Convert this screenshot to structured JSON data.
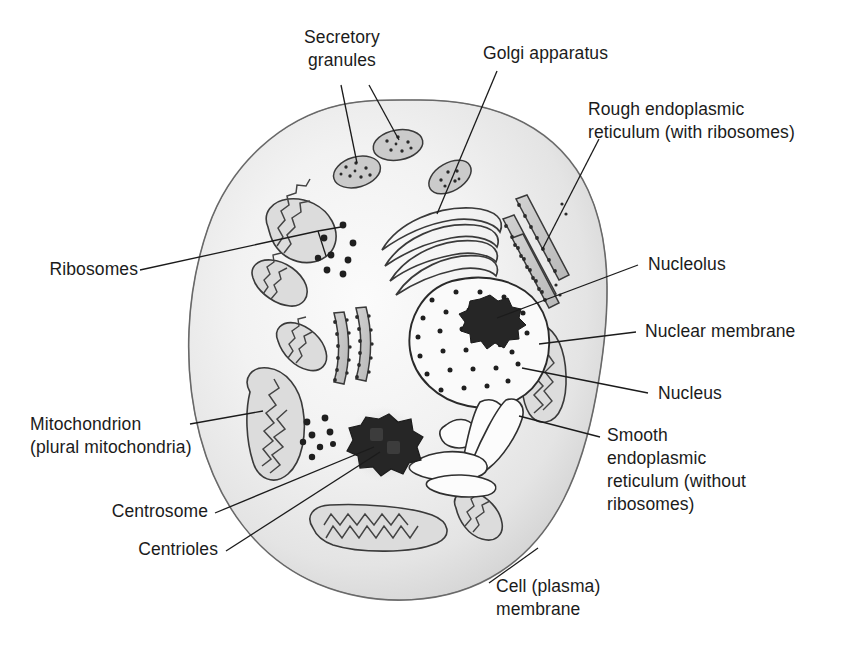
{
  "figure": {
    "kind": "animal-cell-diagram",
    "background_color": "#ffffff",
    "ink_color": "#1b1b1b",
    "cytoplasm_fill": "#e9e9e9",
    "organelle_fill": "#c9c9c9",
    "dark_fill": "#2b2b2b"
  },
  "labels": {
    "secretory_granules": "Secretory\ngranules",
    "golgi_apparatus": "Golgi apparatus",
    "rough_er": "Rough endoplasmic\nreticulum (with ribosomes)",
    "nucleolus": "Nucleolus",
    "nuclear_membrane": "Nuclear membrane",
    "nucleus": "Nucleus",
    "smooth_er": "Smooth\nendoplasmic\nreticulum (without\nribosomes)",
    "ribosomes": "Ribosomes",
    "mitochondrion": "Mitochondrion\n(plural mitochondria)",
    "centrosome": "Centrosome",
    "centrioles": "Centrioles",
    "cell_membrane": "Cell (plasma)\nmembrane"
  },
  "structures": [
    {
      "name": "cell-plasma-membrane",
      "count": 1
    },
    {
      "name": "secretory-granule",
      "count": 3
    },
    {
      "name": "mitochondrion",
      "count": 6
    },
    {
      "name": "golgi-cisterna",
      "count": 4
    },
    {
      "name": "rough-er-cisterna",
      "count": 5
    },
    {
      "name": "smooth-er-tubule",
      "count": 4
    },
    {
      "name": "ribosome-dot",
      "count": 16
    },
    {
      "name": "nucleus",
      "count": 1
    },
    {
      "name": "nucleolus",
      "count": 1
    },
    {
      "name": "centrosome",
      "count": 1
    }
  ]
}
